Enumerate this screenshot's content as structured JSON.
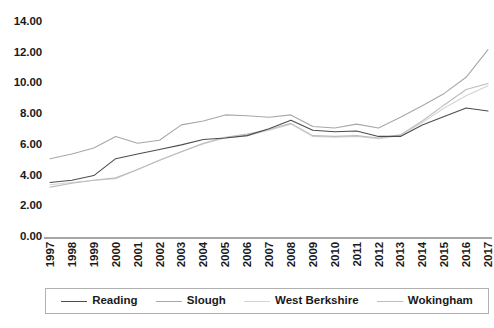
{
  "chart_data": {
    "type": "line",
    "title": "",
    "xlabel": "",
    "ylabel": "",
    "ylim": [
      0,
      14
    ],
    "ytick_labels": [
      "14.00",
      "12.00",
      "10.00",
      "8.00",
      "6.00",
      "4.00",
      "2.00",
      "0.00"
    ],
    "ytick_values": [
      14,
      12,
      10,
      8,
      6,
      4,
      2,
      0
    ],
    "grid": false,
    "legend_position": "bottom",
    "categories": [
      "1997",
      "1998",
      "1999",
      "2000",
      "2001",
      "2002",
      "2003",
      "2004",
      "2005",
      "2006",
      "2007",
      "2008",
      "2009",
      "2010",
      "2011",
      "2012",
      "2013",
      "2014",
      "2015",
      "2016",
      "2017"
    ],
    "series": [
      {
        "name": "Reading",
        "color": "#4d4d4d",
        "values": [
          3.55,
          3.7,
          4.0,
          5.1,
          5.4,
          5.7,
          6.0,
          6.35,
          6.45,
          6.6,
          7.05,
          7.6,
          6.95,
          6.85,
          6.9,
          6.55,
          6.55,
          7.3,
          7.85,
          8.4,
          8.2
        ]
      },
      {
        "name": "Slough",
        "color": "#a8a8a8",
        "values": [
          5.1,
          5.4,
          5.8,
          6.55,
          6.1,
          6.3,
          7.3,
          7.55,
          7.95,
          7.9,
          7.8,
          7.95,
          7.2,
          7.1,
          7.35,
          7.1,
          7.8,
          8.55,
          9.35,
          10.4,
          12.2
        ]
      },
      {
        "name": "West Berkshire",
        "color": "#d4d4d4",
        "values": [
          3.4,
          3.55,
          3.7,
          3.8,
          4.4,
          5.0,
          5.55,
          6.05,
          6.45,
          6.6,
          6.95,
          7.35,
          6.55,
          6.5,
          6.55,
          6.4,
          6.6,
          7.45,
          8.4,
          9.2,
          9.85
        ]
      },
      {
        "name": "Wokingham",
        "color": "#bcbcbc",
        "values": [
          3.25,
          3.5,
          3.7,
          3.85,
          4.4,
          5.0,
          5.55,
          6.1,
          6.5,
          6.7,
          7.0,
          7.4,
          6.6,
          6.55,
          6.6,
          6.45,
          6.65,
          7.55,
          8.6,
          9.6,
          10.0
        ]
      }
    ]
  },
  "legend": {
    "items": [
      {
        "label": "Reading",
        "color": "#4d4d4d"
      },
      {
        "label": "Slough",
        "color": "#a8a8a8"
      },
      {
        "label": "West Berkshire",
        "color": "#d4d4d4"
      },
      {
        "label": "Wokingham",
        "color": "#bcbcbc"
      }
    ]
  },
  "axis": {
    "line_color": "#a6a6a6"
  }
}
